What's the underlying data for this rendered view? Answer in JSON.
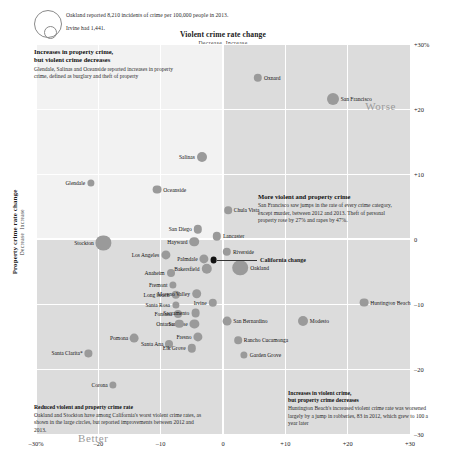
{
  "legend": {
    "line1": "Oakland reported 8,210 incidents of crime per 100,000 people in 2013.",
    "line2": "Irvine had 1,441.",
    "big_circle": "legend-large-bubble",
    "small_circle": "legend-small-bubble"
  },
  "annotations": {
    "top_left": {
      "heading": "Increases in property crime,\nbut violent crime decreases",
      "heading_line1": "Increases in property crime,",
      "heading_line2": "but violent crime decreases",
      "body": "Glendale, Salinas and Oceanside reported increases in property crime, defined as burglary and theft of property"
    },
    "middle_right": {
      "heading": "More violent and property crime",
      "body": "San Francisco saw jumps in the rate of every crime category, except murder, between 2012 and 2013. Theft of personal property rose by 27% and rapes by 47%."
    },
    "bottom_left": {
      "heading": "Reduced violent and property crime rate",
      "body": "Oakland and Stockton have among California's worst violent crime rates, as shown in the large circles, but reported improvements between 2012 and 2013."
    },
    "bottom_right": {
      "heading_line1": "Increases in violent crime,",
      "heading_line2": "but property crime decreases",
      "body": "Huntington Beach's increased violent crime rate was worsened largely by a jump in robberies, 83 in 2012, which grew to 100 a year later"
    }
  },
  "quadrant_labels": {
    "worse": "Worse",
    "better": "Better"
  },
  "chart_data": {
    "type": "scatter",
    "title": "",
    "xlabel": "Violent crime rate change",
    "xlabel_sub_left": "Decrease",
    "xlabel_sub_right": "Increase",
    "ylabel": "Property crime rate change",
    "ylabel_sub_left": "Decrease",
    "ylabel_sub_right": "Increase",
    "xlim": [
      -30,
      30
    ],
    "ylim": [
      -30,
      30
    ],
    "xticks": [
      "–30%",
      "–20",
      "–10",
      "0",
      "+10",
      "+20",
      "+30"
    ],
    "xtick_values": [
      -30,
      -20,
      -10,
      0,
      10,
      20,
      30
    ],
    "yticks": [
      "+30%",
      "+20",
      "+10",
      "0",
      "–10",
      "–20",
      "–30"
    ],
    "ytick_values": [
      30,
      20,
      10,
      0,
      -10,
      -20,
      -30
    ],
    "grid": true,
    "legend": "none",
    "size_encoding": "incidents of crime per 100,000 people in 2013",
    "points": [
      {
        "name": "Oxnard",
        "x": 5.6,
        "y": 24.8,
        "r": 4.2,
        "side": "right"
      },
      {
        "name": "San Francisco",
        "x": 17.6,
        "y": 21.6,
        "r": 6.0,
        "side": "right"
      },
      {
        "name": "Salinas",
        "x": -3.4,
        "y": 12.6,
        "r": 5.0,
        "side": "left"
      },
      {
        "name": "Glendale",
        "x": -21.2,
        "y": 8.6,
        "r": 3.6,
        "side": "left"
      },
      {
        "name": "Oceanside",
        "x": -10.6,
        "y": 7.6,
        "r": 4.4,
        "side": "right"
      },
      {
        "name": "Chula Vista",
        "x": 0.8,
        "y": 4.4,
        "r": 3.8,
        "side": "right"
      },
      {
        "name": "Stockton",
        "x": -19.2,
        "y": -0.6,
        "r": 7.6,
        "side": "left"
      },
      {
        "name": "San Diego",
        "x": -4.0,
        "y": 1.5,
        "r": 4.2,
        "side": "left"
      },
      {
        "name": "Hayward",
        "x": -4.6,
        "y": -0.4,
        "r": 4.8,
        "side": "left"
      },
      {
        "name": "Lancaster",
        "x": -1.0,
        "y": 0.4,
        "r": 4.2,
        "side": "right"
      },
      {
        "name": "Los Angeles",
        "x": -9.2,
        "y": -2.4,
        "r": 4.6,
        "side": "left"
      },
      {
        "name": "Riverside",
        "x": 0.6,
        "y": -2.0,
        "r": 4.2,
        "side": "right"
      },
      {
        "name": "Palmdale",
        "x": -3.0,
        "y": -3.0,
        "r": 4.6,
        "side": "left"
      },
      {
        "name": "Bakersfield",
        "x": -2.6,
        "y": -4.6,
        "r": 5.2,
        "side": "left"
      },
      {
        "name": "Oakland",
        "x": 2.8,
        "y": -4.4,
        "r": 7.8,
        "side": "right"
      },
      {
        "name": "Anaheim",
        "x": -8.4,
        "y": -5.2,
        "r": 4.0,
        "side": "left"
      },
      {
        "name": "Fremont",
        "x": -8.0,
        "y": -7.0,
        "r": 3.6,
        "side": "left"
      },
      {
        "name": "Long beach",
        "x": -7.6,
        "y": -8.6,
        "r": 4.2,
        "side": "left"
      },
      {
        "name": "Moreno Valley",
        "x": -4.2,
        "y": -8.4,
        "r": 4.8,
        "side": "left"
      },
      {
        "name": "Santa Rosa",
        "x": -7.6,
        "y": -10.2,
        "r": 3.6,
        "side": "left"
      },
      {
        "name": "Irvine",
        "x": -1.6,
        "y": -9.8,
        "r": 4.2,
        "side": "left"
      },
      {
        "name": "Fontana",
        "x": -7.2,
        "y": -11.6,
        "r": 4.0,
        "side": "left"
      },
      {
        "name": "Sacramento",
        "x": -4.4,
        "y": -11.4,
        "r": 4.4,
        "side": "left"
      },
      {
        "name": "San Jose",
        "x": -4.6,
        "y": -13.0,
        "r": 4.6,
        "side": "left"
      },
      {
        "name": "Ontario",
        "x": -7.0,
        "y": -13.0,
        "r": 4.2,
        "side": "left"
      },
      {
        "name": "San Bernardino",
        "x": 0.6,
        "y": -12.6,
        "r": 4.4,
        "side": "right"
      },
      {
        "name": "Modesto",
        "x": 12.8,
        "y": -12.6,
        "r": 5.0,
        "side": "right"
      },
      {
        "name": "Huntington Beach",
        "x": 22.6,
        "y": -9.8,
        "r": 4.4,
        "side": "right"
      },
      {
        "name": "Pomona",
        "x": -14.2,
        "y": -15.2,
        "r": 4.4,
        "side": "left"
      },
      {
        "name": "Fresno",
        "x": -4.0,
        "y": -15.0,
        "r": 4.6,
        "side": "left"
      },
      {
        "name": "Santa Ana",
        "x": -8.6,
        "y": -16.2,
        "r": 4.0,
        "side": "left"
      },
      {
        "name": "Elk Grove",
        "x": -5.0,
        "y": -16.8,
        "r": 4.2,
        "side": "left"
      },
      {
        "name": "Rancho Cucamonga",
        "x": 2.4,
        "y": -15.6,
        "r": 3.8,
        "side": "right"
      },
      {
        "name": "Garden Grove",
        "x": 3.4,
        "y": -17.8,
        "r": 3.6,
        "side": "right"
      },
      {
        "name": "Santa Clarita*",
        "x": -21.6,
        "y": -17.6,
        "r": 3.6,
        "side": "left"
      },
      {
        "name": "Corona",
        "x": -17.6,
        "y": -22.4,
        "r": 3.6,
        "side": "left"
      }
    ],
    "california": {
      "name": "California change",
      "x": -1.5,
      "y": -3.2,
      "r": 3.4,
      "color": "#111111"
    }
  },
  "colors": {
    "bubble": "#9a9a9a",
    "california": "#111111",
    "quadrant_shade": "#dcdcdc",
    "plot_background": "#f2f2f2",
    "quadrant_word": "#9a9a9a"
  }
}
